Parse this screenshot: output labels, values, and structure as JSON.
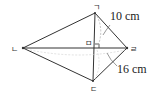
{
  "diagram": {
    "vertices": {
      "top": "ㄱ",
      "left": "ㄴ",
      "bottom": "ㄷ",
      "right": "ㄹ",
      "center": "ㅁ"
    },
    "measurements": {
      "upper": "10 cm",
      "lower": "16 cm"
    },
    "colors": {
      "stroke": "#333333",
      "dashed": "#aaaaaa",
      "text": "#222222"
    }
  }
}
